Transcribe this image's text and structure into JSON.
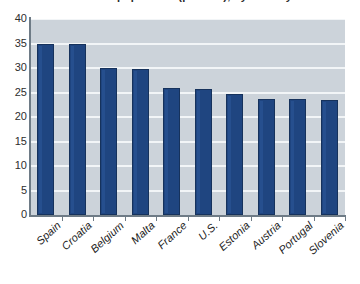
{
  "chart_data": {
    "type": "bar",
    "title": "Share of population (percent), by country",
    "title_cropped": true,
    "xlabel": "",
    "ylabel": "",
    "ylim": [
      0,
      40
    ],
    "ytick_step": 5,
    "yticks": [
      "40",
      "35",
      "30",
      "25",
      "20",
      "15",
      "10",
      "5",
      "0"
    ],
    "grid": true,
    "grid_color": "#f2f5f7",
    "plot_background": "#ccd3da",
    "bar_color": "#1f4580",
    "bar_edge_color": "#16325c",
    "legend": "none",
    "categories": [
      "Spain",
      "Croatia",
      "Belgium",
      "Malta",
      "France",
      "U.S.",
      "Estonia",
      "Austria",
      "Portugal",
      "Slovenia"
    ],
    "values": [
      35.0,
      34.8,
      30.0,
      29.8,
      25.9,
      25.8,
      24.7,
      23.6,
      23.6,
      23.5
    ]
  },
  "source_credit": "Source: OECD",
  "axis": {
    "y_axis_name": "y-axis",
    "x_axis_name": "x-axis"
  }
}
